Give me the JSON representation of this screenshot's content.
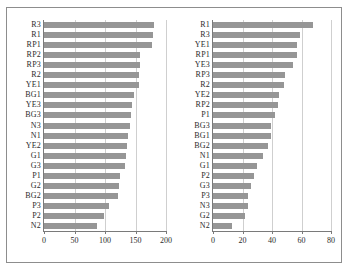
{
  "figure": {
    "background_color": "#ffffff",
    "frame_color": "#8d8d8d",
    "bar_color": "#969696",
    "grid_color": "#cfcfcf",
    "axis_color": "#7a7a7a",
    "text_color": "#2b2b2b"
  },
  "chart_data": [
    {
      "type": "bar",
      "orientation": "horizontal",
      "panel": "left",
      "title": "",
      "xlabel": "",
      "ylabel": "",
      "xlim": [
        0,
        200
      ],
      "xticks": [
        0,
        50,
        100,
        150,
        200
      ],
      "xtick_labels": [
        "0",
        "50",
        "100",
        "150",
        "200"
      ],
      "grid": true,
      "legend": "none",
      "categories": [
        "R3",
        "R1",
        "RP1",
        "RP2",
        "RP3",
        "R2",
        "YE1",
        "BG1",
        "YE3",
        "BG3",
        "N3",
        "N1",
        "YE2",
        "G1",
        "G3",
        "P1",
        "G2",
        "BG2",
        "P3",
        "P2",
        "N2"
      ],
      "values": [
        180,
        179,
        177,
        158,
        157,
        156,
        155,
        148,
        145,
        142,
        141,
        138,
        136,
        135,
        133,
        125,
        123,
        122,
        107,
        99,
        87
      ]
    },
    {
      "type": "bar",
      "orientation": "horizontal",
      "panel": "right",
      "title": "",
      "xlabel": "",
      "ylabel": "",
      "xlim": [
        0,
        80
      ],
      "xticks": [
        0,
        20,
        40,
        60,
        80
      ],
      "xtick_labels": [
        "0",
        "20",
        "40",
        "60",
        "80"
      ],
      "grid": true,
      "legend": "none",
      "categories": [
        "R1",
        "R3",
        "YE1",
        "RP1",
        "YE3",
        "RP3",
        "R2",
        "YE2",
        "RP2",
        "P1",
        "BG3",
        "BG1",
        "BG2",
        "N1",
        "G1",
        "P2",
        "G3",
        "P3",
        "N3",
        "G2",
        "N2"
      ],
      "values": [
        68,
        59,
        57,
        57,
        54,
        49,
        48,
        45,
        44,
        42,
        39,
        39,
        37,
        34,
        30,
        28,
        26,
        24,
        24,
        22,
        13
      ]
    }
  ]
}
